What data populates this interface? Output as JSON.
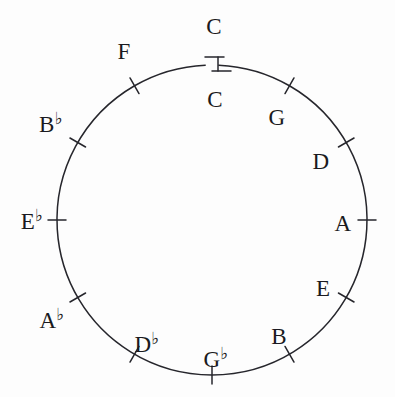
{
  "figure": {
    "name": "circle-of-fifths",
    "background_color": "#fdfdfd",
    "stroke_color": "#26262c",
    "text_color": "#1a1a20",
    "width": 395,
    "height": 397
  },
  "circle": {
    "center_x": 212,
    "center_y": 220,
    "radius": 155,
    "gap_top": true,
    "gap_start_deg": -92.5,
    "gap_end_deg": -87.5,
    "connector_x": 218,
    "connector_y_top": 57,
    "connector_y_bottom": 71
  },
  "labels": [
    {
      "id": "c-top",
      "text": "C",
      "base": "C",
      "accidental": "",
      "x": 214,
      "y": 26,
      "placement": "outside-top",
      "angle_deg": -90
    },
    {
      "id": "c-bottom",
      "text": "C",
      "base": "C",
      "accidental": "",
      "x": 215,
      "y": 99,
      "placement": "inside-top",
      "angle_deg": -90
    },
    {
      "id": "g",
      "text": "G",
      "base": "G",
      "accidental": "",
      "x": 277,
      "y": 117,
      "placement": "inside",
      "angle_deg": -60
    },
    {
      "id": "d",
      "text": "D",
      "base": "D",
      "accidental": "",
      "x": 321,
      "y": 161,
      "placement": "inside",
      "angle_deg": -30
    },
    {
      "id": "a",
      "text": "A",
      "base": "A",
      "accidental": "",
      "x": 343,
      "y": 223,
      "placement": "inside",
      "angle_deg": 0
    },
    {
      "id": "e",
      "text": "E",
      "base": "E",
      "accidental": "",
      "x": 323,
      "y": 288,
      "placement": "inside",
      "angle_deg": 30
    },
    {
      "id": "b",
      "text": "B",
      "base": "B",
      "accidental": "",
      "x": 279,
      "y": 336,
      "placement": "inside",
      "angle_deg": 60
    },
    {
      "id": "gb",
      "text": "G♭",
      "base": "G",
      "accidental": "♭",
      "x": 216,
      "y": 359,
      "placement": "inside-bottom",
      "angle_deg": 90
    },
    {
      "id": "db",
      "text": "D♭",
      "base": "D",
      "accidental": "♭",
      "x": 147,
      "y": 344,
      "placement": "inside",
      "angle_deg": 120
    },
    {
      "id": "ab",
      "text": "A♭",
      "base": "A",
      "accidental": "♭",
      "x": 52,
      "y": 320,
      "placement": "outside",
      "angle_deg": 150
    },
    {
      "id": "eb",
      "text": "E♭",
      "base": "E",
      "accidental": "♭",
      "x": 32,
      "y": 221,
      "placement": "outside",
      "angle_deg": 180
    },
    {
      "id": "bb",
      "text": "B♭",
      "base": "B",
      "accidental": "♭",
      "x": 51,
      "y": 124,
      "placement": "outside",
      "angle_deg": -150
    },
    {
      "id": "f",
      "text": "F",
      "base": "F",
      "accidental": "",
      "x": 124,
      "y": 51,
      "placement": "inside",
      "angle_deg": -120
    }
  ],
  "ticks": [
    {
      "id": "tick-g",
      "angle_deg": -60,
      "label_id": "g"
    },
    {
      "id": "tick-d",
      "angle_deg": -30,
      "label_id": "d"
    },
    {
      "id": "tick-a",
      "angle_deg": 0,
      "label_id": "a"
    },
    {
      "id": "tick-e",
      "angle_deg": 30,
      "label_id": "e"
    },
    {
      "id": "tick-b",
      "angle_deg": 60,
      "label_id": "b"
    },
    {
      "id": "tick-gb",
      "angle_deg": 90,
      "label_id": "gb"
    },
    {
      "id": "tick-db",
      "angle_deg": 120,
      "label_id": "db"
    },
    {
      "id": "tick-ab",
      "angle_deg": 150,
      "label_id": "ab"
    },
    {
      "id": "tick-eb",
      "angle_deg": 180,
      "label_id": "eb"
    },
    {
      "id": "tick-bb",
      "angle_deg": -150,
      "label_id": "bb"
    },
    {
      "id": "tick-f",
      "angle_deg": -120,
      "label_id": "f"
    }
  ],
  "chart_data": {
    "type": "scatter",
    "xlabel": "",
    "ylabel": "",
    "grid": false,
    "legend": "none",
    "categories": [
      "C",
      "G",
      "D",
      "A",
      "E",
      "B",
      "G♭",
      "D♭",
      "A♭",
      "E♭",
      "B♭",
      "F",
      "C"
    ],
    "x": [
      -90,
      -60,
      -30,
      0,
      30,
      60,
      90,
      120,
      150,
      180,
      -150,
      -120,
      -90
    ],
    "values": [
      0,
      1,
      2,
      3,
      4,
      5,
      6,
      5,
      4,
      3,
      2,
      1,
      0
    ],
    "series": [
      {
        "name": "keys around the circle",
        "values": [
          "C",
          "G",
          "D",
          "A",
          "E",
          "B",
          "G♭",
          "D♭",
          "A♭",
          "E♭",
          "B♭",
          "F",
          "C"
        ]
      }
    ],
    "annotations": [
      "Open break at the top of the circle between the two C labels",
      "Sharp-side keys G D A E B labelled inside the circle",
      "Flat-side keys G♭ D♭ A♭ E♭ B♭ labelled outside/inside at lower-left"
    ]
  }
}
